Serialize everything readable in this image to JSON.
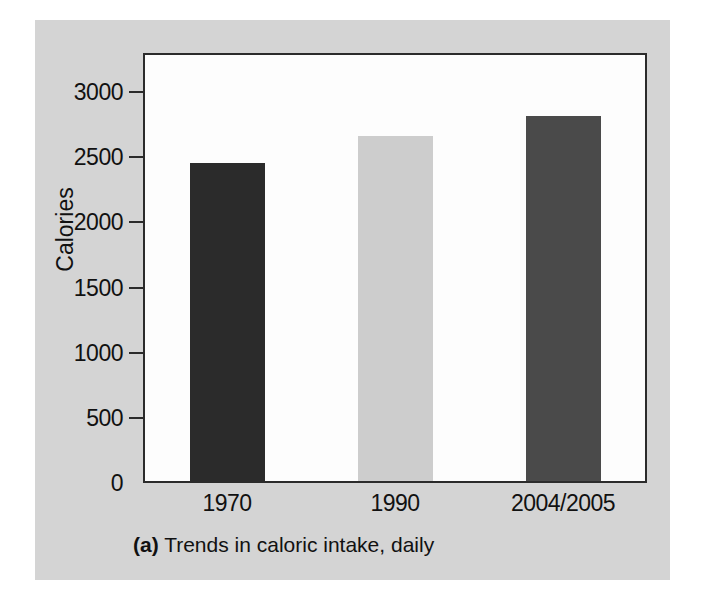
{
  "figure": {
    "caption_tag": "(a)",
    "caption_text": "Trends in caloric intake, daily",
    "panel_background": "#d4d4d4",
    "plot_background": "#fdfdfd",
    "frame_color": "#2b2b2b"
  },
  "chart_data": {
    "type": "bar",
    "title": "Trends in caloric intake, daily",
    "xlabel": "",
    "ylabel": "Calories",
    "categories": [
      "1970",
      "1990",
      "2004/2005"
    ],
    "values": [
      2440,
      2650,
      2800
    ],
    "bar_colors": [
      "#2b2b2b",
      "#cdcdcd",
      "#4a4a4a"
    ],
    "ylim": [
      0,
      3300
    ],
    "yticks": [
      0,
      500,
      1000,
      1500,
      2000,
      2500,
      3000
    ],
    "ytick_labels": [
      "0",
      "500",
      "1000",
      "1500",
      "2000",
      "2500",
      "3000"
    ],
    "grid": false,
    "legend": null
  }
}
